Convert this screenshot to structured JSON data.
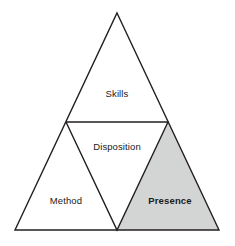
{
  "diagram": {
    "type": "nested-triangle-quadrants",
    "title": "",
    "background_color": "#ffffff",
    "stroke_color": "#231f20",
    "stroke_width": 1.4,
    "geometry": {
      "apex": {
        "x": 117,
        "y": 13
      },
      "bottom_left": {
        "x": 15,
        "y": 230
      },
      "bottom_right": {
        "x": 219,
        "y": 230
      },
      "mid_left": {
        "x": 66,
        "y": 122
      },
      "mid_right": {
        "x": 168,
        "y": 122
      },
      "mid_bottom": {
        "x": 117,
        "y": 230
      }
    },
    "regions": [
      {
        "id": "skills",
        "label": "Skills",
        "position": "top",
        "fill": "#ffffff",
        "emphasis": "normal",
        "label_x": 117,
        "label_y": 94,
        "vertices": "apex, mid_left, mid_right"
      },
      {
        "id": "disposition",
        "label": "Disposition",
        "position": "center-inverted",
        "fill": "#ffffff",
        "emphasis": "normal",
        "label_x": 117,
        "label_y": 147,
        "vertices": "mid_left, mid_right, mid_bottom"
      },
      {
        "id": "method",
        "label": "Method",
        "position": "bottom-left",
        "fill": "#ffffff",
        "emphasis": "normal",
        "label_x": 66,
        "label_y": 201,
        "vertices": "mid_left, mid_bottom, bottom_left"
      },
      {
        "id": "presence",
        "label": "Presence",
        "position": "bottom-right",
        "fill": "#d3d5d4",
        "emphasis": "bold",
        "label_x": 170,
        "label_y": 201,
        "vertices": "mid_right, bottom_right, mid_bottom"
      }
    ]
  }
}
